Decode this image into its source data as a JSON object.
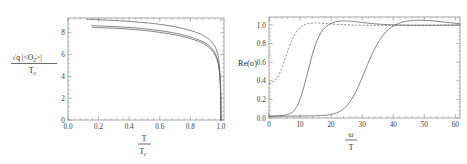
{
  "figure": {
    "background": "#ffffff",
    "curve_color": "#5b5b5b",
    "frame_color": "#8e8e8e"
  },
  "chart_data": [
    {
      "type": "line",
      "panel": "left",
      "title": "",
      "xlabel": "T / T_c",
      "ylabel": "sqrt(q |<O_2>|) / T_c",
      "xlabel_parts": {
        "num": "T",
        "den": "T",
        "den_sub": "c"
      },
      "ylabel_parts": {
        "num": "√q |<O",
        "num_sub": "2",
        "num_end": ">|",
        "den": "T",
        "den_sub": "c"
      },
      "xlim": [
        0.0,
        1.02
      ],
      "ylim": [
        0.0,
        9.35
      ],
      "xticks": [
        0.0,
        0.2,
        0.4,
        0.6,
        0.8,
        1.0
      ],
      "xticklabels": [
        "0.0",
        "0.2",
        "0.4",
        "0.6",
        "0.8",
        "1.0"
      ],
      "yticks": [
        0,
        2,
        4,
        6,
        8
      ],
      "yticklabels": [
        "0",
        "2",
        "4",
        "6",
        "8"
      ],
      "grid": false,
      "legend": "none",
      "series": [
        {
          "name": "curve-upper",
          "style": "solid",
          "x": [
            0.125,
            0.18,
            0.25,
            0.32,
            0.4,
            0.48,
            0.56,
            0.63,
            0.7,
            0.76,
            0.81,
            0.855,
            0.89,
            0.92,
            0.945,
            0.962,
            0.975,
            0.985,
            0.992,
            0.997,
            0.999,
            1.0
          ],
          "y": [
            9.22,
            9.2,
            9.16,
            9.11,
            9.04,
            8.95,
            8.84,
            8.71,
            8.55,
            8.36,
            8.16,
            7.94,
            7.7,
            7.43,
            7.06,
            6.7,
            6.25,
            5.6,
            4.7,
            3.4,
            2.2,
            0.0
          ]
        },
        {
          "name": "curve-middle",
          "style": "solid",
          "x": [
            0.155,
            0.21,
            0.28,
            0.35,
            0.42,
            0.5,
            0.57,
            0.64,
            0.71,
            0.77,
            0.82,
            0.86,
            0.895,
            0.925,
            0.948,
            0.964,
            0.976,
            0.986,
            0.993,
            0.997,
            0.999,
            1.0
          ],
          "y": [
            8.64,
            8.62,
            8.58,
            8.53,
            8.46,
            8.36,
            8.25,
            8.11,
            7.93,
            7.73,
            7.52,
            7.31,
            7.07,
            6.78,
            6.42,
            6.05,
            5.6,
            4.95,
            4.05,
            2.85,
            1.8,
            0.0
          ]
        },
        {
          "name": "curve-lower",
          "style": "solid",
          "x": [
            0.16,
            0.22,
            0.29,
            0.36,
            0.43,
            0.51,
            0.58,
            0.65,
            0.72,
            0.78,
            0.83,
            0.868,
            0.9,
            0.928,
            0.95,
            0.966,
            0.978,
            0.987,
            0.9935,
            0.9975,
            0.9992,
            1.0
          ],
          "y": [
            8.48,
            8.46,
            8.42,
            8.37,
            8.29,
            8.19,
            8.07,
            7.93,
            7.75,
            7.54,
            7.33,
            7.12,
            6.88,
            6.58,
            6.22,
            5.84,
            5.38,
            4.72,
            3.82,
            2.62,
            1.6,
            0.0
          ]
        }
      ]
    },
    {
      "type": "line",
      "panel": "right",
      "title": "",
      "xlabel": "ω / T",
      "ylabel": "Re(σ)",
      "xlabel_parts": {
        "num": "ω",
        "den": "T"
      },
      "xlim": [
        0,
        61.5
      ],
      "ylim": [
        0.0,
        1.085
      ],
      "xticks": [
        0,
        10,
        20,
        30,
        40,
        50,
        60
      ],
      "xticklabels": [
        "0",
        "10",
        "20",
        "30",
        "40",
        "50",
        "60"
      ],
      "yticks": [
        0.0,
        0.2,
        0.4,
        0.6,
        0.8,
        1.0
      ],
      "yticklabels": [
        "0.0",
        "0.2",
        "0.4",
        "0.6",
        "0.8",
        "1.0"
      ],
      "grid": false,
      "legend": "none",
      "series": [
        {
          "name": "curve-dashed-low-gap",
          "style": "dashed",
          "x": [
            0,
            0.6,
            1.2,
            1.8,
            2.5,
            3.2,
            4.0,
            4.8,
            5.6,
            6.4,
            7.2,
            8.0,
            8.8,
            9.6,
            10.4,
            11.2,
            12.0,
            13.0,
            14.5,
            16.0,
            18.0,
            20.0,
            23.0,
            26.0,
            30.0,
            35.0,
            40.0,
            46.0,
            52.0,
            57.0,
            61.5
          ],
          "y": [
            0.37,
            0.375,
            0.385,
            0.4,
            0.425,
            0.465,
            0.525,
            0.6,
            0.675,
            0.75,
            0.82,
            0.88,
            0.925,
            0.958,
            0.982,
            0.998,
            1.008,
            1.016,
            1.021,
            1.021,
            1.016,
            1.01,
            1.004,
            1.0,
            0.997,
            0.995,
            0.995,
            0.996,
            0.997,
            0.998,
            0.999
          ]
        },
        {
          "name": "curve-mid-gap",
          "style": "solid",
          "x": [
            0,
            1.5,
            3.0,
            4.5,
            6.0,
            7.0,
            8.0,
            9.0,
            10.0,
            11.0,
            12.0,
            13.0,
            14.0,
            15.0,
            16.0,
            17.0,
            18.0,
            19.0,
            20.0,
            21.0,
            22.0,
            23.5,
            25.0,
            27.0,
            30.0,
            34.0,
            38.0,
            43.0,
            48.0,
            54.0,
            61.5
          ],
          "y": [
            0.018,
            0.019,
            0.022,
            0.027,
            0.038,
            0.052,
            0.078,
            0.125,
            0.2,
            0.305,
            0.43,
            0.56,
            0.685,
            0.79,
            0.872,
            0.93,
            0.97,
            0.998,
            1.017,
            1.03,
            1.038,
            1.043,
            1.043,
            1.038,
            1.026,
            1.012,
            1.003,
            0.998,
            0.996,
            0.996,
            0.998
          ]
        },
        {
          "name": "curve-high-gap",
          "style": "solid",
          "x": [
            0,
            3.0,
            6.0,
            9.0,
            12.0,
            15.0,
            17.0,
            19.0,
            20.5,
            22.0,
            23.5,
            25.0,
            26.5,
            28.0,
            29.5,
            31.0,
            32.5,
            34.0,
            35.5,
            37.0,
            38.5,
            40.0,
            42.0,
            44.0,
            46.5,
            49.0,
            52.0,
            55.0,
            58.0,
            61.5
          ],
          "y": [
            0.02,
            0.02,
            0.02,
            0.021,
            0.022,
            0.024,
            0.027,
            0.033,
            0.042,
            0.058,
            0.085,
            0.128,
            0.195,
            0.285,
            0.395,
            0.515,
            0.635,
            0.742,
            0.832,
            0.902,
            0.952,
            0.987,
            1.02,
            1.038,
            1.048,
            1.05,
            1.045,
            1.036,
            1.025,
            1.012
          ]
        }
      ]
    }
  ]
}
